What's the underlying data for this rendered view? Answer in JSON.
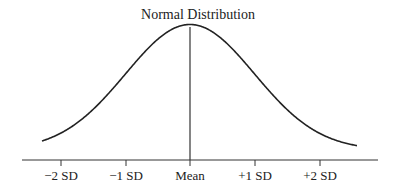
{
  "chart_data": {
    "type": "line",
    "title": "Normal Distribution",
    "xlabel": "",
    "ylabel": "",
    "categories": [
      "−2 SD",
      "−1 SD",
      "Mean",
      "+1 SD",
      "+2 SD"
    ],
    "x_tick_values": [
      -2,
      -1,
      0,
      1,
      2
    ],
    "series": [
      {
        "name": "Normal density",
        "x": [
          -2.3,
          -2,
          -1.5,
          -1,
          -0.5,
          0,
          0.5,
          1,
          1.5,
          2,
          2.6
        ],
        "values": [
          0.028,
          0.054,
          0.13,
          0.242,
          0.352,
          0.399,
          0.352,
          0.242,
          0.13,
          0.054,
          0.014
        ]
      }
    ],
    "annotations": [
      "vertical line at Mean"
    ],
    "xlim": [
      -2.6,
      3.0
    ],
    "grid": false,
    "legend": "none"
  },
  "ticks": [
    {
      "label": "−2 SD",
      "x": 61
    },
    {
      "label": "−1 SD",
      "x": 126
    },
    {
      "label": "Mean",
      "x": 190
    },
    {
      "label": "+1 SD",
      "x": 255
    },
    {
      "label": "+2 SD",
      "x": 320
    }
  ]
}
